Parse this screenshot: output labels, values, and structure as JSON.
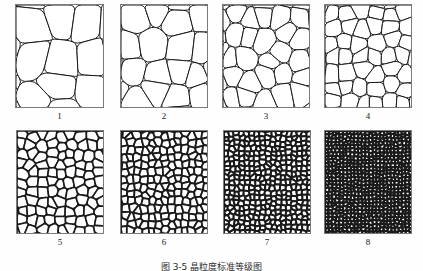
{
  "figure": {
    "caption": "图 3-5  晶粒度标准等级图",
    "background_color": "#fefefe",
    "frame_color": "#7b7b7b",
    "grain_line_color": "#1a1a1a",
    "grain_fill_color": "#ffffff",
    "rows": 2,
    "columns": 4
  },
  "panels": [
    {
      "label": "1",
      "grade": 1,
      "x": 15,
      "y": 0,
      "width": 89,
      "height": 104,
      "cells": 9,
      "line_width": 1.0,
      "seed": 11,
      "jitter": 0.34,
      "description": "coarsest grains"
    },
    {
      "label": "2",
      "grade": 2,
      "x": 120,
      "y": 0,
      "width": 88,
      "height": 104,
      "cells": 16,
      "line_width": 1.0,
      "seed": 23,
      "jitter": 0.32,
      "description": "very coarse grains"
    },
    {
      "label": "3",
      "grade": 3,
      "x": 222,
      "y": 0,
      "width": 88,
      "height": 104,
      "cells": 25,
      "line_width": 1.0,
      "seed": 37,
      "jitter": 0.32,
      "description": "coarse grains"
    },
    {
      "label": "4",
      "grade": 4,
      "x": 324,
      "y": 0,
      "width": 88,
      "height": 104,
      "cells": 42,
      "line_width": 1.0,
      "seed": 51,
      "jitter": 0.3,
      "description": "medium-coarse grains"
    },
    {
      "label": "5",
      "grade": 5,
      "x": 16,
      "y": 0,
      "width": 88,
      "height": 104,
      "cells": 95,
      "line_width": 1.6,
      "seed": 67,
      "jitter": 0.3,
      "description": "medium grains"
    },
    {
      "label": "6",
      "grade": 6,
      "x": 120,
      "y": 0,
      "width": 88,
      "height": 104,
      "cells": 185,
      "line_width": 1.8,
      "seed": 83,
      "jitter": 0.29,
      "description": "medium-fine grains"
    },
    {
      "label": "7",
      "grade": 7,
      "x": 223,
      "y": 0,
      "width": 88,
      "height": 104,
      "cells": 360,
      "line_width": 2.0,
      "seed": 97,
      "jitter": 0.28,
      "description": "fine grains"
    },
    {
      "label": "8",
      "grade": 8,
      "x": 324,
      "y": 0,
      "width": 88,
      "height": 104,
      "cells": 700,
      "line_width": 2.2,
      "seed": 113,
      "jitter": 0.27,
      "description": "finest grains"
    }
  ]
}
